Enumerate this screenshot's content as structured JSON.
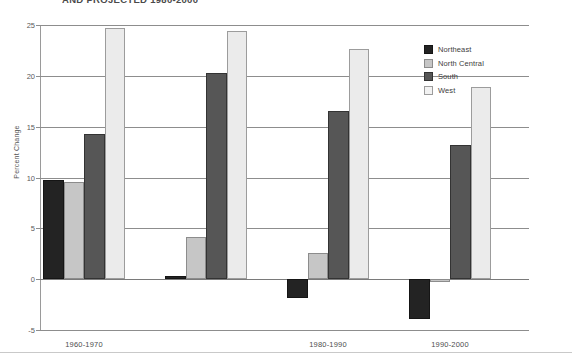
{
  "figure": {
    "title_visible_fragment": "AND PROJECTED 1980-2000",
    "page_edge": "bottom-rule"
  },
  "legend": {
    "position": "top-right",
    "entries": [
      {
        "label": "Northeast",
        "key": "northeast",
        "color": "#232323"
      },
      {
        "label": "North Central",
        "key": "north_central",
        "color": "#c6c6c6"
      },
      {
        "label": "South",
        "key": "south",
        "color": "#565656"
      },
      {
        "label": "West",
        "key": "west",
        "color": "#f2f2f2"
      }
    ]
  },
  "axes": {
    "y_label": "Percent Change",
    "y_ticks": [
      "25",
      "20",
      "15",
      "10",
      "5",
      "0",
      "-5"
    ],
    "x_ticks": [
      "1960-1970",
      "1970-1980",
      "1980-1990",
      "1990-2000"
    ]
  },
  "chart_data": {
    "type": "bar",
    "title": "AND PROJECTED 1980-2000",
    "xlabel": "",
    "ylabel": "Percent Change",
    "ylim": [
      -5,
      25
    ],
    "ytick_values": [
      25,
      20,
      15,
      10,
      5,
      0,
      -5
    ],
    "grid": true,
    "legend_position": "top-right",
    "categories": [
      "1960-1970",
      "1970-1980",
      "1980-1990",
      "1990-2000"
    ],
    "series": [
      {
        "name": "Northeast",
        "color": "#232323",
        "values": [
          9.8,
          0.3,
          -1.9,
          -3.9
        ]
      },
      {
        "name": "North Central",
        "color": "#c6c6c6",
        "values": [
          9.6,
          4.1,
          2.6,
          -0.3
        ]
      },
      {
        "name": "South",
        "color": "#565656",
        "values": [
          14.3,
          20.3,
          16.5,
          13.2
        ]
      },
      {
        "name": "West",
        "color": "#ebebeb",
        "values": [
          24.7,
          24.4,
          22.6,
          18.9
        ]
      }
    ]
  }
}
